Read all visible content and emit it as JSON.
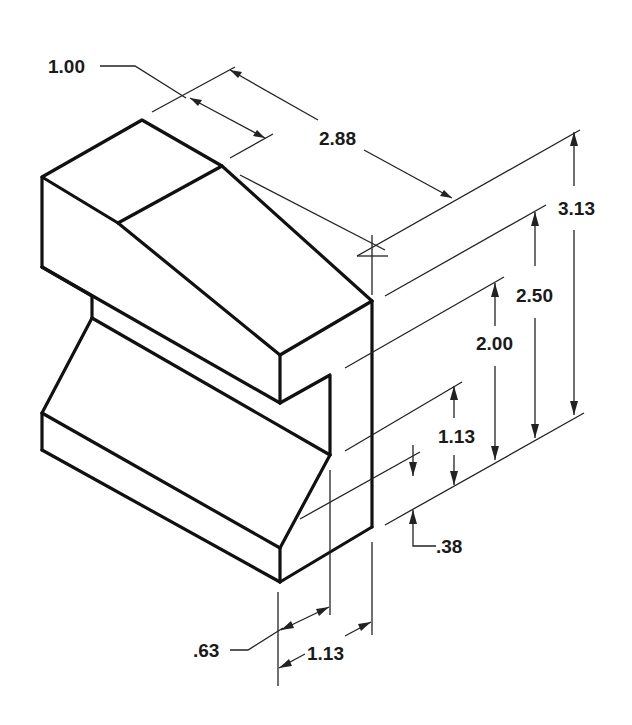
{
  "figure": {
    "type": "isometric engineering drawing"
  },
  "dimensions": {
    "top_flat": "1.00",
    "depth": "2.88",
    "overall_height": "3.13",
    "height_upper": "2.50",
    "height_notch_top": "2.00",
    "notch_height": "1.13",
    "base_offset": ".38",
    "notch_depth": ".63",
    "base_step": "1.13"
  },
  "colors": {
    "ink": "#111111",
    "background": "#ffffff"
  }
}
